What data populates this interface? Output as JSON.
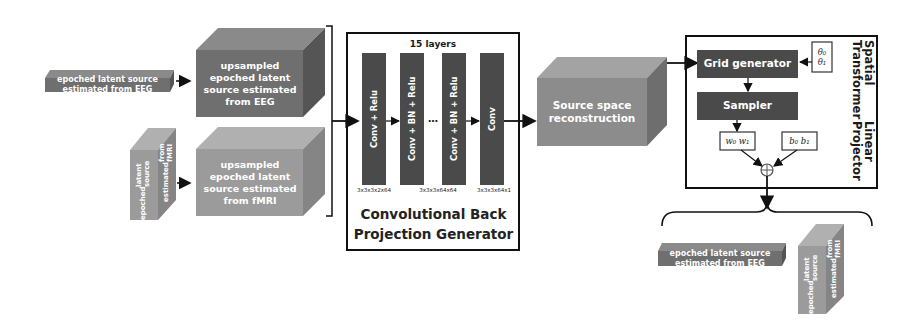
{
  "colors": {
    "eeg_front": "#6f6f6f",
    "eeg_top": "#8a8a8a",
    "eeg_side": "#555555",
    "fmri_front": "#9b9b9b",
    "fmri_top": "#b0b0b0",
    "fmri_side": "#858585",
    "recon_front": "#8c8c8c",
    "recon_top": "#a3a3a3",
    "recon_side": "#6e6e6e",
    "layer_block": "#4a4a4a",
    "stn_block": "#4a4a4a",
    "line": "#111111"
  },
  "inputs": {
    "eeg_slab": "epoched latent source estimated from EEG",
    "fmri_cube_lines": [
      "epoched",
      "latent source",
      "estimated",
      "from fMRI"
    ]
  },
  "upsampled": {
    "eeg": "upsampled epoched latent source estimated from EEG",
    "fmri": "upsampled epoched latent source estimated from fMRI"
  },
  "generator": {
    "layers_label": "15 layers",
    "blocks": [
      {
        "label": "Conv + Relu",
        "dims": "3x3x3x2x64"
      },
      {
        "label": "Conv + BN + Relu",
        "dims": "3x3x3x64x64"
      },
      {
        "label": "Conv + BN + Relu",
        "dims": ""
      },
      {
        "label": "Conv",
        "dims": "3x3x3x64x1"
      }
    ],
    "ellipsis": "…",
    "title_line1": "Convolutional Back",
    "title_line2": "Projection Generator"
  },
  "reconstruction": {
    "label": "Source space reconstruction"
  },
  "stn": {
    "title_line1": "Spatial  Transformer",
    "title_line2": "Linear Projector",
    "grid_generator": "Grid generator",
    "sampler": "Sampler",
    "theta": [
      "θ₀",
      "θ₁"
    ],
    "weights": "w₀ w₁",
    "biases": "b₀ b₁",
    "sum_symbol": "⊕"
  },
  "outputs": {
    "eeg_slab": "epoched latent source estimated from EEG",
    "fmri_cube_lines": [
      "epoched",
      "latent source",
      "estimated",
      "from fMRI"
    ]
  }
}
